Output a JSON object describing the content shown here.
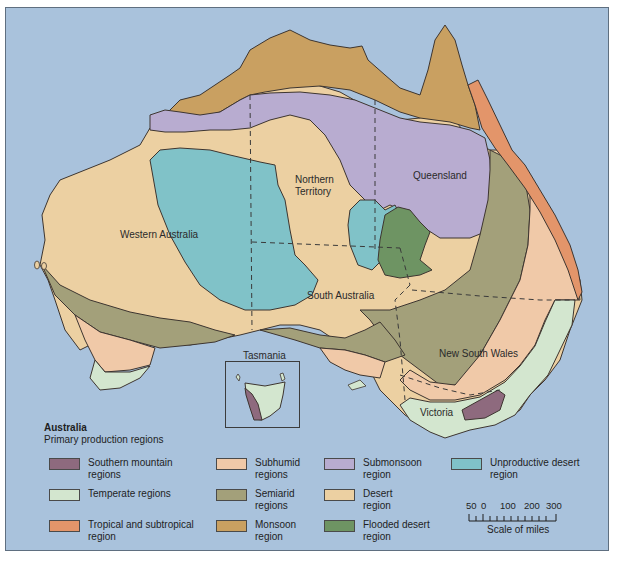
{
  "map": {
    "title": "Australia",
    "subtitle": "Primary production regions",
    "labels": {
      "western_australia": "Western Australia",
      "northern_territory_1": "Northern",
      "northern_territory_2": "Territory",
      "queensland": "Queensland",
      "south_australia": "South Australia",
      "new_south_wales": "New South Wales",
      "victoria": "Victoria",
      "tasmania": "Tasmania"
    },
    "colors": {
      "ocean": "#a9c2dc",
      "southern_mountain": "#8e6a7e",
      "temperate": "#d3e6cf",
      "tropical_subtropical": "#e3956a",
      "subhumid": "#f0c9a8",
      "semiarid": "#a3a07a",
      "monsoon": "#c9a061",
      "submonsoon": "#b8acd0",
      "desert": "#ecd0a2",
      "flooded_desert": "#6e9463",
      "unproductive_desert": "#80c2c8"
    }
  },
  "legend": {
    "items": [
      {
        "key": "southern_mountain",
        "label_1": "Southern mountain",
        "label_2": "regions",
        "color": "#8e6a7e"
      },
      {
        "key": "temperate",
        "label_1": "Temperate regions",
        "label_2": "",
        "color": "#d3e6cf"
      },
      {
        "key": "tropical_subtropical",
        "label_1": "Tropical and subtropical",
        "label_2": "region",
        "color": "#e3956a"
      },
      {
        "key": "subhumid",
        "label_1": "Subhumid",
        "label_2": "regions",
        "color": "#f0c9a8"
      },
      {
        "key": "semiarid",
        "label_1": "Semiarid",
        "label_2": "regions",
        "color": "#a3a07a"
      },
      {
        "key": "monsoon",
        "label_1": "Monsoon",
        "label_2": "region",
        "color": "#c9a061"
      },
      {
        "key": "submonsoon",
        "label_1": "Submonsoon",
        "label_2": "region",
        "color": "#b8acd0"
      },
      {
        "key": "desert",
        "label_1": "Desert",
        "label_2": "region",
        "color": "#ecd0a2"
      },
      {
        "key": "flooded_desert",
        "label_1": "Flooded desert",
        "label_2": "region",
        "color": "#6e9463"
      },
      {
        "key": "unproductive_desert",
        "label_1": "Unproductive desert",
        "label_2": "region",
        "color": "#80c2c8"
      }
    ]
  },
  "scale": {
    "ticks": [
      "50",
      "0",
      "100",
      "200",
      "300"
    ],
    "caption": "Scale of miles"
  }
}
